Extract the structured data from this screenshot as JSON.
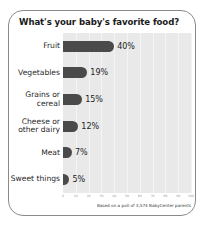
{
  "card": {
    "title": "What's your baby's favorite food?",
    "footnote": "Based on a poll of 3,574 BabyCenter parents"
  },
  "chart_data": {
    "type": "bar",
    "orientation": "horizontal",
    "title": "What's your baby's favorite food?",
    "categories": [
      "Fruit",
      "Vegetables",
      "Grains or cereal",
      "Cheese or other dairy",
      "Meat",
      "Sweet things"
    ],
    "values": [
      40,
      19,
      15,
      12,
      7,
      5
    ],
    "value_labels": [
      "40%",
      "19%",
      "15%",
      "12%",
      "7%",
      "5%"
    ],
    "xlabel": "",
    "ylabel": "",
    "xlim": [
      0,
      100
    ],
    "xticks": [
      0,
      10,
      20,
      30,
      40,
      50,
      60,
      70,
      80,
      90,
      100
    ],
    "xtick_labels": [
      "0",
      "10",
      "20",
      "30",
      "40",
      "50",
      "60",
      "70",
      "80",
      "90",
      "100"
    ],
    "grid": true,
    "legend": false,
    "annotation": "Based on a poll of 3,574 BabyCenter parents",
    "colors": {
      "bar": "#4a4a4a",
      "plot_background": "#e9e9e9",
      "gridline": "#f4f4f4",
      "card_background": "#ffffff",
      "card_border": "#8a8a8a",
      "title_text": "#1a1a1a",
      "label_text": "#1f1f1f",
      "tick_text": "#9b9b9b"
    }
  }
}
